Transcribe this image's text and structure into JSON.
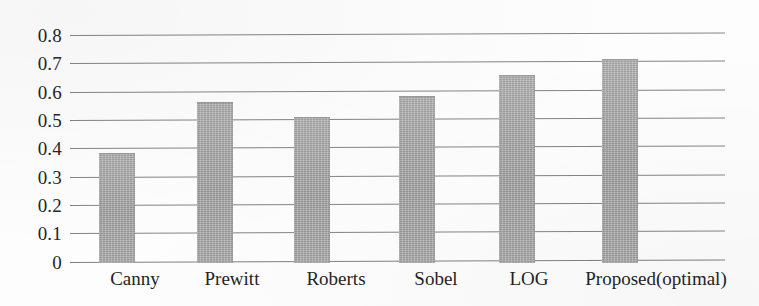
{
  "chart_data": {
    "type": "bar",
    "title": "",
    "xlabel": "",
    "ylabel": "",
    "categories": [
      "Canny",
      "Prewitt",
      "Roberts",
      "Sobel",
      "LOG",
      "Proposed(optimal)"
    ],
    "values": [
      0.385,
      0.565,
      0.51,
      0.585,
      0.66,
      0.715
    ],
    "series": [
      {
        "name": "",
        "values": [
          0.385,
          0.565,
          0.51,
          0.585,
          0.66,
          0.715
        ]
      }
    ],
    "ylim": [
      0,
      0.8
    ],
    "ytick_labels": [
      "0.8",
      "0.7",
      "0.6",
      "0.5",
      "0.4",
      "0.3",
      "0.2",
      "0.1",
      "0"
    ],
    "ytick_values": [
      0.8,
      0.7,
      0.6,
      0.5,
      0.4,
      0.3,
      0.2,
      0.1,
      0
    ],
    "grid": "horizontal",
    "legend": "none",
    "bar_color": "#a9a9a9",
    "gridline_color": "#6f6f6f",
    "text_color": "#242424",
    "background_color": "#fdfdfd"
  },
  "axis": {
    "y": {
      "ticks": [
        {
          "label": "0.8",
          "value": 0.8
        },
        {
          "label": "0.7",
          "value": 0.7
        },
        {
          "label": "0.6",
          "value": 0.6
        },
        {
          "label": "0.5",
          "value": 0.5
        },
        {
          "label": "0.4",
          "value": 0.4
        },
        {
          "label": "0.3",
          "value": 0.3
        },
        {
          "label": "0.2",
          "value": 0.2
        },
        {
          "label": "0.1",
          "value": 0.1
        },
        {
          "label": "0",
          "value": 0
        }
      ]
    },
    "x": {
      "ticks": [
        {
          "label": "Canny"
        },
        {
          "label": "Prewitt"
        },
        {
          "label": "Roberts"
        },
        {
          "label": "Sobel"
        },
        {
          "label": "LOG"
        },
        {
          "label": "Proposed(optimal)"
        }
      ]
    }
  }
}
